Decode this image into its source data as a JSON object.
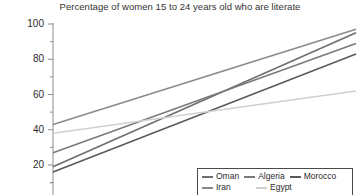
{
  "chart_data": {
    "type": "line",
    "title": "Percentage of women 15 to 24 years old who are literate",
    "xlabel": "",
    "ylabel": "",
    "ylim": [
      10,
      100
    ],
    "yticks": [
      20,
      40,
      60,
      80,
      100
    ],
    "ytick_labels": [
      "20",
      "40",
      "60",
      "80",
      "100"
    ],
    "yminor_ticks": [
      10,
      30,
      50,
      70,
      90
    ],
    "xlim": [
      0,
      1
    ],
    "x": [
      0,
      1
    ],
    "grid": false,
    "legend_position": "bottom-right",
    "series": [
      {
        "name": "Oman",
        "color": "#6e6e6e",
        "values": [
          19,
          95
        ]
      },
      {
        "name": "Algeria",
        "color": "#7a7a7a",
        "values": [
          27,
          89
        ]
      },
      {
        "name": "Morocco",
        "color": "#5a5a5a",
        "values": [
          16,
          83
        ]
      },
      {
        "name": "Iran",
        "color": "#8a8a8a",
        "values": [
          43,
          97
        ]
      },
      {
        "name": "Egypt",
        "color": "#d0d0d0",
        "values": [
          38,
          62
        ]
      }
    ]
  },
  "axis": {
    "line_color": "#8c8c8c",
    "tick_color": "#8c8c8c"
  },
  "legend": {
    "rows": [
      [
        {
          "label": "Oman",
          "color": "#6e6e6e"
        },
        {
          "label": "Algeria",
          "color": "#7a7a7a"
        },
        {
          "label": "Morocco",
          "color": "#5a5a5a"
        }
      ],
      [
        {
          "label": "Iran",
          "color": "#8a8a8a"
        },
        {
          "label": "Egypt",
          "color": "#d0d0d0"
        }
      ]
    ]
  }
}
